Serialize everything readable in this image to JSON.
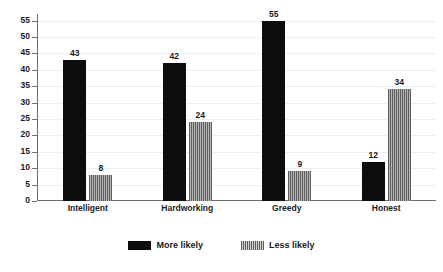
{
  "chart_data": {
    "type": "bar",
    "title": "",
    "subtitle": "",
    "xlabel": "",
    "ylabel": "",
    "categories": [
      "Intelligent",
      "Hardworking",
      "Greedy",
      "Honest"
    ],
    "series": [
      {
        "name": "More likely",
        "values": [
          43,
          42,
          55,
          12
        ],
        "color": "#0d0d0d",
        "pattern": "solid"
      },
      {
        "name": "Less likely",
        "values": [
          8,
          24,
          9,
          34
        ],
        "color": "#8c8c8c",
        "pattern": "vertical-stripes"
      }
    ],
    "ylim": [
      0,
      57
    ],
    "yticks": [
      0,
      5,
      10,
      15,
      20,
      25,
      30,
      35,
      40,
      45,
      50,
      55
    ],
    "ytick_labels": [
      "0",
      "5",
      "10",
      "15",
      "20",
      "25",
      "30",
      "35",
      "40",
      "45",
      "50",
      "55"
    ],
    "grid": true,
    "grid_axis": "y",
    "legend_position": "bottom",
    "value_labels": true,
    "background_color": "#ffffff",
    "gridline_color": "#eceff1",
    "axis_color": "#6e6e6e"
  },
  "legend": {
    "items": [
      {
        "label": "More likely"
      },
      {
        "label": "Less likely"
      }
    ]
  }
}
